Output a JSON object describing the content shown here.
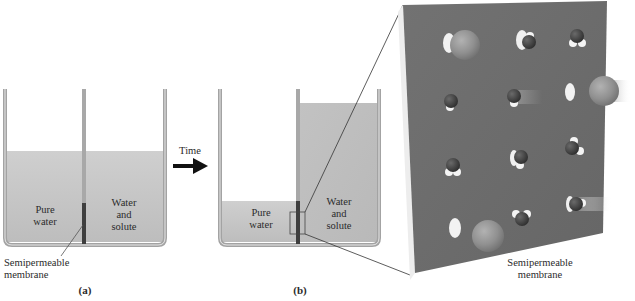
{
  "figure": {
    "panel_a": {
      "label": "(a)",
      "left_compartment": {
        "line1": "Pure",
        "line2": "water"
      },
      "right_compartment": {
        "line1": "Water",
        "line2": "and",
        "line3": "solute"
      },
      "membrane_label": {
        "line1": "Semipermeable",
        "line2": "membrane"
      }
    },
    "arrow": {
      "label": "Time"
    },
    "panel_b": {
      "label": "(b)",
      "left_compartment": {
        "line1": "Pure",
        "line2": "water"
      },
      "right_compartment": {
        "line1": "Water",
        "line2": "and",
        "line3": "solute"
      }
    },
    "magnified_view": {
      "membrane_label": {
        "line1": "Semipermeable",
        "line2": "membrane"
      }
    }
  },
  "colors": {
    "liquid": "#c9c9c9",
    "beaker_wall": "#9a9a9a",
    "membrane_face": "#6e6e6e",
    "membrane_side": "#ececec",
    "solute": "#8f8f8f",
    "water_oxygen": "#3e3e3e",
    "water_hydrogen": "#f4f4f4"
  }
}
